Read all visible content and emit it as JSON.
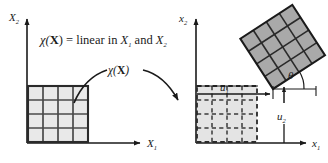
{
  "figure": {
    "name": "deformation-mapping-diagram",
    "colors": {
      "ink": "#1a1a1a",
      "grid_line": "#4a4a4a",
      "reference_fill": "#e9e9e9",
      "deformed_fill": "#a9a9a9",
      "dashed_fill": "#e4e4e4",
      "background": "#ffffff"
    }
  },
  "annotation": {
    "equation_map": "χ(",
    "equation_bold_X": "X",
    "equation_rest": ") = linear in ",
    "equation_var1": "X",
    "equation_var1_sub": "1",
    "equation_and": " and ",
    "equation_var2": "X",
    "equation_var2_sub": "2",
    "full_text": "χ(X) = linear in X1 and X2",
    "arrow_label_chi": "χ(",
    "arrow_label_X": "X",
    "arrow_label_close": ")"
  },
  "left_panel": {
    "name": "reference-configuration",
    "axis_y_label": "X",
    "axis_y_sub": "2",
    "axis_x_label": "X",
    "axis_x_sub": "1",
    "grid_rows": 4,
    "grid_cols": 4,
    "line_style": "solid"
  },
  "right_panel": {
    "name": "current-configuration",
    "axis_y_label": "x",
    "axis_y_sub": "2",
    "axis_x_label": "x",
    "axis_x_sub": "1",
    "dashed_grid_rows": 4,
    "dashed_grid_cols": 4,
    "dashed_line_style": "dashed",
    "rotated_grid_rows": 4,
    "rotated_grid_cols": 4,
    "rotation_angle_deg": 33,
    "displacement_u1_label": "u",
    "displacement_u1_sub": "1",
    "displacement_u2_label": "u",
    "displacement_u2_sub": "2",
    "angle_label": "θ"
  }
}
